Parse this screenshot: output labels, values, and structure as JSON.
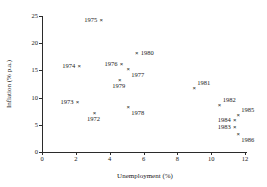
{
  "chart_data": {
    "type": "scatter",
    "title": "",
    "xlabel": "Unemployment (%)",
    "ylabel": "Inflation (% p.a.)",
    "xlim": [
      0,
      12
    ],
    "ylim": [
      0,
      25
    ],
    "xticks": [
      "0",
      "2",
      "4",
      "6",
      "8",
      "10",
      "12"
    ],
    "yticks": [
      "0",
      "5",
      "10",
      "15",
      "20",
      "25"
    ],
    "grid": false,
    "legend": "none",
    "marker": "x",
    "marker_color": "#1a1a1a",
    "points": [
      {
        "label": "1975",
        "x": 3.5,
        "y": 24.2,
        "label_pos": "left"
      },
      {
        "label": "1980",
        "x": 5.6,
        "y": 18.2,
        "label_pos": "right"
      },
      {
        "label": "1976",
        "x": 4.7,
        "y": 16.2,
        "label_pos": "left"
      },
      {
        "label": "1974",
        "x": 2.2,
        "y": 15.8,
        "label_pos": "left"
      },
      {
        "label": "1977",
        "x": 5.1,
        "y": 15.3,
        "label_pos": "below-right"
      },
      {
        "label": "1979",
        "x": 4.6,
        "y": 13.2,
        "label_pos": "below"
      },
      {
        "label": "1981",
        "x": 9.0,
        "y": 11.7,
        "label_pos": "above-right"
      },
      {
        "label": "1973",
        "x": 2.1,
        "y": 9.2,
        "label_pos": "left"
      },
      {
        "label": "1982",
        "x": 10.5,
        "y": 8.7,
        "label_pos": "above-right"
      },
      {
        "label": "1978",
        "x": 5.1,
        "y": 8.3,
        "label_pos": "below-right"
      },
      {
        "label": "1972",
        "x": 3.1,
        "y": 7.1,
        "label_pos": "below"
      },
      {
        "label": "1985",
        "x": 11.6,
        "y": 6.8,
        "label_pos": "above-right"
      },
      {
        "label": "1984",
        "x": 11.4,
        "y": 5.8,
        "label_pos": "left"
      },
      {
        "label": "1983",
        "x": 11.4,
        "y": 4.6,
        "label_pos": "left"
      },
      {
        "label": "1986",
        "x": 11.6,
        "y": 3.4,
        "label_pos": "below-right"
      }
    ]
  }
}
